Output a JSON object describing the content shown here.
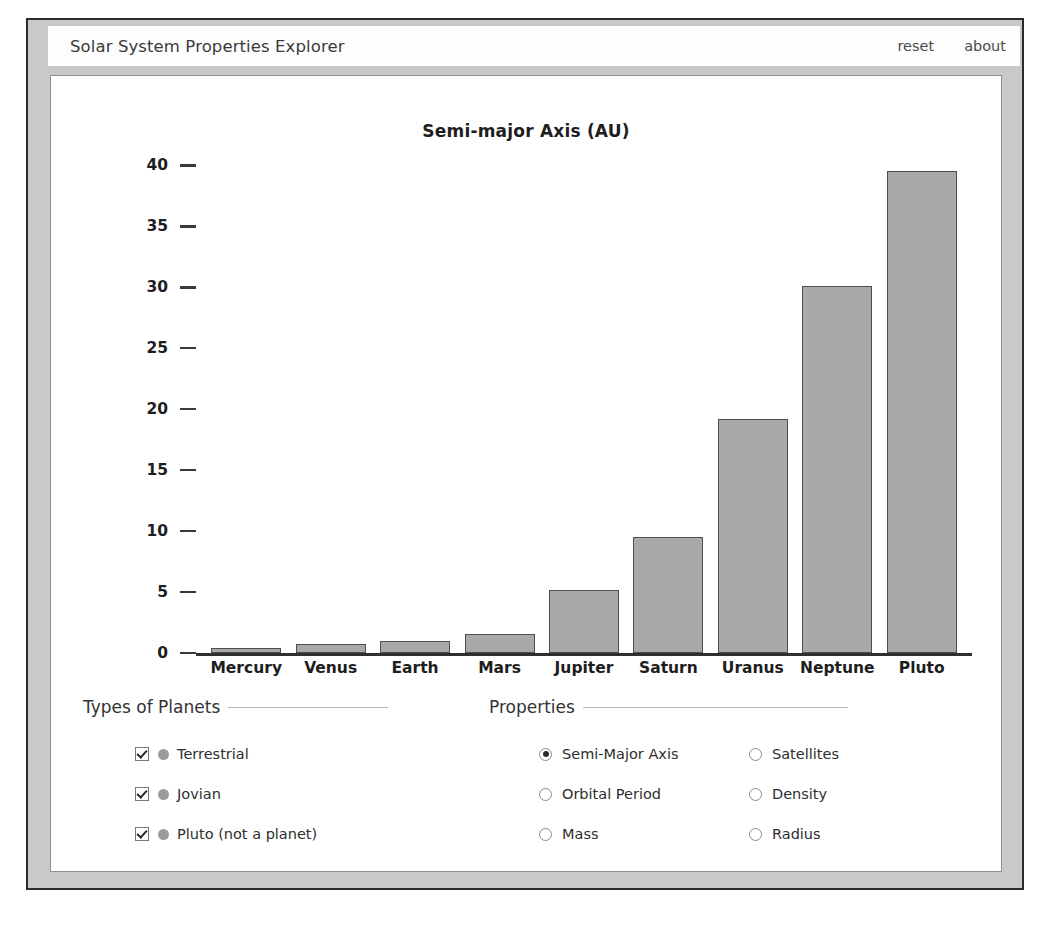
{
  "window": {
    "title": "Solar System Properties Explorer",
    "reset_label": "reset",
    "about_label": "about"
  },
  "chart_data": {
    "type": "bar",
    "title": "Semi-major Axis (AU)",
    "xlabel": "",
    "ylabel": "",
    "categories": [
      "Mercury",
      "Venus",
      "Earth",
      "Mars",
      "Jupiter",
      "Saturn",
      "Uranus",
      "Neptune",
      "Pluto"
    ],
    "values": [
      0.39,
      0.72,
      1.0,
      1.52,
      5.2,
      9.54,
      19.2,
      30.1,
      39.5
    ],
    "ylim": [
      0,
      42
    ],
    "yticks": [
      0,
      5,
      10,
      15,
      20,
      25,
      30,
      35,
      40
    ],
    "ytick_labels": [
      "0",
      "5",
      "10",
      "15",
      "20",
      "25",
      "30",
      "35",
      "40"
    ],
    "grid": false,
    "legend": "none",
    "bar_color": "#a9a9a9",
    "bar_edge_color": "#4e4e4e"
  },
  "types_group": {
    "header": "Types of Planets",
    "items": [
      {
        "label": "Terrestrial",
        "checked": true,
        "swatch": "#9b9b9b"
      },
      {
        "label": "Jovian",
        "checked": true,
        "swatch": "#9b9b9b"
      },
      {
        "label": "Pluto (not a planet)",
        "checked": true,
        "swatch": "#9b9b9b"
      }
    ]
  },
  "properties_group": {
    "header": "Properties",
    "selected": "Semi-Major Axis",
    "left_column": [
      {
        "label": "Semi-Major Axis",
        "selected": true
      },
      {
        "label": "Orbital Period",
        "selected": false
      },
      {
        "label": "Mass",
        "selected": false
      }
    ],
    "right_column": [
      {
        "label": "Satellites",
        "selected": false
      },
      {
        "label": "Density",
        "selected": false
      },
      {
        "label": "Radius",
        "selected": false
      }
    ]
  }
}
